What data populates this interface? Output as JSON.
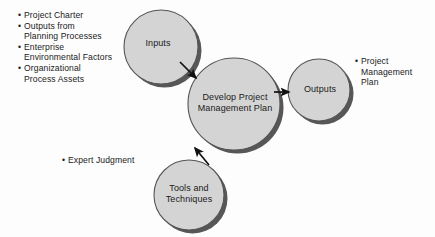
{
  "diagram": {
    "colors": {
      "background": "#fdfdfd",
      "circle_fill": "#d4d4d4",
      "circle_stroke": "#555555",
      "shadow": "#3a3a3a",
      "text": "#1a1a1a",
      "arrow": "#111111"
    },
    "nodes": {
      "inputs": {
        "label": "Inputs"
      },
      "process": {
        "label": "Develop Project\nManagement Plan"
      },
      "outputs": {
        "label": "Outputs"
      },
      "tools": {
        "label": "Tools and\nTechniques"
      }
    },
    "inputs_list": {
      "bullet": "•",
      "items": [
        "Project Charter",
        "Outputs from\nPlanning Processes",
        "Enterprise\nEnvironmental Factors",
        "Organizational\nProcess Assets"
      ]
    },
    "tools_list": {
      "bullet": "•",
      "items": [
        "Expert Judgment"
      ]
    },
    "outputs_list": {
      "bullet": "•",
      "items": [
        "Project\nManagement\nPlan"
      ]
    }
  }
}
